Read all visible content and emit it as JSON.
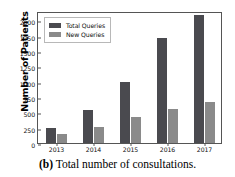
{
  "figure": {
    "caption_tag": "(b)",
    "caption_text": "Total number of consultations."
  },
  "colors": {
    "total_queries": "#4a4a4f",
    "new_queries": "#8a8a8a",
    "axis": "#555555",
    "background": "#ffffff",
    "text": "#111111"
  },
  "chart_data": {
    "type": "bar",
    "title": "",
    "xlabel": "",
    "ylabel": "Number of Patients",
    "categories": [
      "2013",
      "2014",
      "2015",
      "2016",
      "2017"
    ],
    "series": [
      {
        "name": "Total Queries",
        "values": [
          240,
          530,
          990,
          1710,
          2090
        ]
      },
      {
        "name": "New Queries",
        "values": [
          145,
          255,
          420,
          560,
          670
        ]
      }
    ],
    "ylim": [
      0,
      2150
    ],
    "yticks": [
      0,
      250,
      500,
      750,
      1000,
      1250,
      1500,
      1750,
      2000
    ],
    "ytick_labels": [
      "0",
      "250",
      "500",
      "750",
      "1000",
      "1250",
      "1500",
      "1750",
      "2000"
    ],
    "grid": false,
    "legend_position": "upper left"
  }
}
